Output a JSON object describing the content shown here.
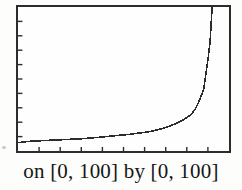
{
  "caption": "on [0, 100] by [0, 100]",
  "colors": {
    "ink": "#2c2c2c",
    "background": "#fdfdfc",
    "caption_text": "#161616"
  },
  "chart_data": {
    "type": "line",
    "title": "",
    "xlabel": "",
    "ylabel": "",
    "xlim": [
      0,
      100
    ],
    "ylim": [
      0,
      100
    ],
    "xtick_interval": 10,
    "ytick_interval": 10,
    "grid": false,
    "legend": false,
    "window_caption": "on [0, 100] by [0, 100]",
    "series": [
      {
        "name": "increasing curve, slow rise then vertical asymptote near x = 92",
        "points": [
          [
            0,
            5.8
          ],
          [
            6,
            6.8
          ],
          [
            20,
            7.8
          ],
          [
            30,
            8.5
          ],
          [
            39,
            9.6
          ],
          [
            46,
            10.6
          ],
          [
            53,
            11.6
          ],
          [
            62,
            13.3
          ],
          [
            67,
            15.0
          ],
          [
            72,
            17.4
          ],
          [
            76,
            19.8
          ],
          [
            79,
            22.2
          ],
          [
            82,
            25.3
          ],
          [
            84,
            29.0
          ],
          [
            86,
            35.2
          ],
          [
            88,
            42.7
          ],
          [
            89,
            52.9
          ],
          [
            90,
            63.1
          ],
          [
            91,
            75.4
          ],
          [
            91.5,
            87.0
          ],
          [
            92,
            100
          ]
        ]
      }
    ]
  }
}
